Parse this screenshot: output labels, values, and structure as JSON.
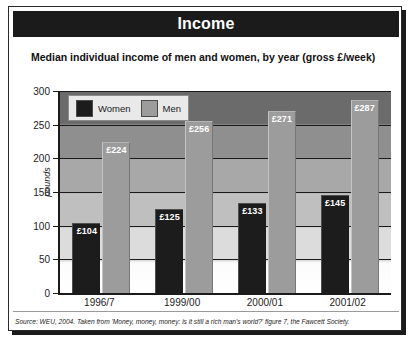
{
  "header": {
    "title": "Income"
  },
  "subtitle": "Median individual income of men and women, by year (gross £/week)",
  "legend": {
    "items": [
      {
        "label": "Women",
        "color": "#1c1c1c",
        "icon": "color-swatch-icon"
      },
      {
        "label": "Men",
        "color": "#9c9c9c",
        "icon": "color-swatch-icon"
      }
    ]
  },
  "source": "Source: WEU, 2004. Taken from 'Money, money, money: is it still a rich man's world?' figure 7, the Fawcett Society.",
  "chart_data": {
    "type": "bar",
    "title": "Income",
    "subtitle": "Median individual income of men and women, by year (gross £/week)",
    "xlabel": "",
    "ylabel": "pounds",
    "ylim": [
      0,
      300
    ],
    "yticks": [
      0,
      50,
      100,
      150,
      200,
      250,
      300
    ],
    "ytick_labels": [
      "0",
      "50",
      "100",
      "150",
      "200",
      "250",
      "300"
    ],
    "grid": true,
    "legend_position": "top-left",
    "categories": [
      "1996/7",
      "1999/00",
      "2000/01",
      "2001/02"
    ],
    "series": [
      {
        "name": "Women",
        "color": "#1c1c1c",
        "values": [
          104,
          125,
          133,
          145
        ],
        "labels": [
          "£104",
          "£125",
          "£133",
          "£145"
        ]
      },
      {
        "name": "Men",
        "color": "#9c9c9c",
        "values": [
          224,
          256,
          271,
          287
        ],
        "labels": [
          "£224",
          "£256",
          "£271",
          "£287"
        ]
      }
    ],
    "annotations": [
      "Source: WEU, 2004. Taken from 'Money, money, money: is it still a rich man's world?' figure 7, the Fawcett Society."
    ]
  }
}
